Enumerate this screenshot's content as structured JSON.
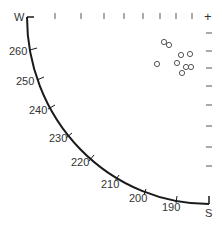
{
  "chart_data": {
    "type": "scatter",
    "title": "",
    "corner_labels": {
      "top_left": "W",
      "bottom_right": "S"
    },
    "arc_tick_labels": [
      "260",
      "250",
      "240",
      "230",
      "220",
      "210",
      "200",
      "190"
    ],
    "arc_range": [
      180,
      270
    ],
    "top_corner_marker": "+",
    "points": [
      {
        "x": 164,
        "y": 42
      },
      {
        "x": 169,
        "y": 45
      },
      {
        "x": 181,
        "y": 55
      },
      {
        "x": 190,
        "y": 54
      },
      {
        "x": 157,
        "y": 64
      },
      {
        "x": 177,
        "y": 63
      },
      {
        "x": 186,
        "y": 67
      },
      {
        "x": 191,
        "y": 67
      },
      {
        "x": 182,
        "y": 73
      }
    ],
    "colors": {
      "line": "#1a1a1a",
      "text": "#333333",
      "marker": "#555555"
    }
  }
}
